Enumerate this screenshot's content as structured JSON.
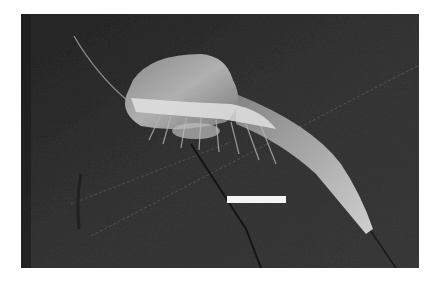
{
  "image": {
    "subject": "fossil shrimp-like crustacean on dark rock slab",
    "style": "grayscale photograph",
    "colors": {
      "background": "#ffffff",
      "rock": "#2e2e2e",
      "fossil_light": "#d8d8d8",
      "fossil_mid": "#9a9a9a",
      "scale_bar": "#f4f4f4"
    },
    "scale_bar": {
      "visible": true,
      "label": ""
    }
  }
}
